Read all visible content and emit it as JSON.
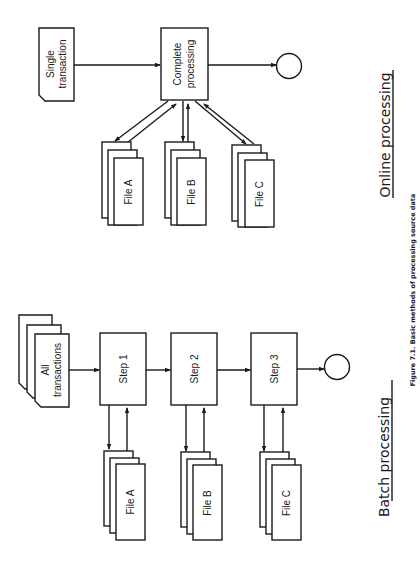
{
  "figure": {
    "caption": "Figure 7.1. Basic methods of processing source data",
    "orientation": "rotated 90° counter-clockwise"
  },
  "online": {
    "title": "Online processing",
    "input": {
      "line1": "Single",
      "line2": "transaction"
    },
    "process": {
      "line1": "Complete",
      "line2": "processing"
    },
    "files": [
      {
        "label": "File  A"
      },
      {
        "label": "File  B"
      },
      {
        "label": "File  C"
      }
    ],
    "output": "terminator-circle"
  },
  "batch": {
    "title": "Batch processing",
    "input": {
      "line1": "All",
      "line2": "transactions"
    },
    "steps": [
      {
        "label": "Step  1"
      },
      {
        "label": "Step  2"
      },
      {
        "label": "Step  3"
      }
    ],
    "files": [
      {
        "label": "File  A"
      },
      {
        "label": "File  B"
      },
      {
        "label": "File  C"
      }
    ],
    "output": "terminator-circle"
  },
  "colors": {
    "ink": "#1a1a1a",
    "paper": "#ffffff"
  }
}
